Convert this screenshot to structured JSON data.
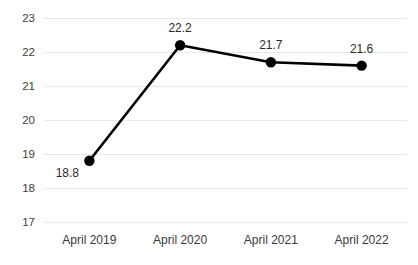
{
  "chart_data": {
    "type": "line",
    "title": "",
    "subtitle": "",
    "xlabel": "",
    "ylabel": "",
    "categories": [
      "April 2019",
      "April 2020",
      "April 2021",
      "April 2022"
    ],
    "values": [
      18.8,
      22.2,
      21.7,
      21.6
    ],
    "data_labels": [
      "18.8",
      "22.2",
      "21.7",
      "21.6"
    ],
    "ylim": [
      17,
      23
    ],
    "yticks": [
      17,
      18,
      19,
      20,
      21,
      22,
      23
    ],
    "ytick_labels": [
      "17",
      "18",
      "19",
      "20",
      "21",
      "22",
      "23"
    ],
    "grid": "horizontal",
    "legend": "none",
    "series": [
      {
        "name": "",
        "values": [
          18.8,
          22.2,
          21.7,
          21.6
        ],
        "color": "#000000",
        "marker": "circle"
      }
    ],
    "colors": {
      "line": "#000000",
      "marker": "#000000",
      "gridline": "#e8e8e8",
      "axis_text": "#3a3a3a",
      "data_label_text": "#2b2b2b",
      "background": "#ffffff"
    }
  }
}
